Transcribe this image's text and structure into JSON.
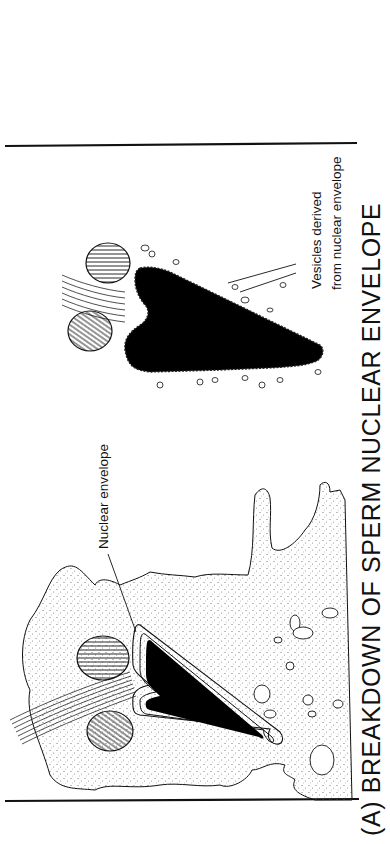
{
  "figure": {
    "title": "(A) BREAKDOWN OF SPERM NUCLEAR ENVELOPE",
    "orientation": "rotated -90deg (text reads bottom-to-top)",
    "labels": {
      "nuclear_envelope": "Nuclear envelope",
      "vesicles_line1": "Vesicles derived",
      "vesicles_line2": "from nuclear envelope"
    },
    "panels": [
      {
        "name": "intact-sperm-nucleus",
        "description": "Sperm nucleus with intact double nuclear envelope inside stippled egg cytoplasm, flanked by two mitochondria and flagellum"
      },
      {
        "name": "fragmenting-sperm-nucleus",
        "description": "Black sperm nucleus with nuclear envelope breaking into small vesicles"
      }
    ],
    "colors": {
      "ink": "#111111",
      "background": "#ffffff",
      "stipple": "#777777"
    }
  }
}
